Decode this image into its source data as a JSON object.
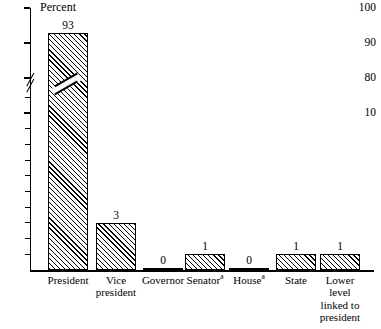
{
  "chart_data": {
    "type": "bar",
    "title": "",
    "ylabel": "Percent",
    "xlabel": "",
    "categories": [
      "President",
      "Vice president",
      "Governor",
      "Senator",
      "House",
      "State",
      "Lower level linked to president"
    ],
    "values": [
      93,
      3,
      0,
      1,
      0,
      1,
      1
    ],
    "ylim": [
      0,
      100
    ],
    "yticks_labeled": [
      100,
      90,
      80,
      10
    ],
    "axis_break": {
      "between": [
        10,
        80
      ],
      "style": "double-slash"
    },
    "grid": false,
    "legend": null,
    "bar_fill": "diagonal-hatch",
    "footnote_marker": "a",
    "footnote_categories": [
      "Senator",
      "House"
    ]
  },
  "axis": {
    "title": "Percent",
    "ticks": [
      {
        "label": "100",
        "value": 100
      },
      {
        "label": "90",
        "value": 90
      },
      {
        "label": "80",
        "value": 80
      },
      {
        "label": "10",
        "value": 10
      }
    ]
  },
  "bars": [
    {
      "id": "president",
      "value_label": "93",
      "label_lines": [
        "President"
      ],
      "superscript": ""
    },
    {
      "id": "vice-president",
      "value_label": "3",
      "label_lines": [
        "Vice",
        "president"
      ],
      "superscript": ""
    },
    {
      "id": "governor",
      "value_label": "0",
      "label_lines": [
        "Governor"
      ],
      "superscript": ""
    },
    {
      "id": "senator",
      "value_label": "1",
      "label_lines": [
        "Senator"
      ],
      "superscript": "a"
    },
    {
      "id": "house",
      "value_label": "0",
      "label_lines": [
        "House"
      ],
      "superscript": "a"
    },
    {
      "id": "state",
      "value_label": "1",
      "label_lines": [
        "State"
      ],
      "superscript": ""
    },
    {
      "id": "lower-level",
      "value_label": "1",
      "label_lines": [
        "Lower",
        "level",
        "linked to",
        "president"
      ],
      "superscript": ""
    }
  ],
  "colors": {
    "ink": "#000000",
    "paper": "#ffffff"
  }
}
